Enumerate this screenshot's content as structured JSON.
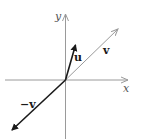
{
  "diagram": {
    "axes": {
      "x_label": "x",
      "y_label": "y",
      "color": "#9a9a9a"
    },
    "vectors": [
      {
        "name": "u",
        "label": "u",
        "color": "#1a1a1a"
      },
      {
        "name": "v",
        "label": "v",
        "color": "#9a9a9a"
      },
      {
        "name": "neg-v",
        "label": "−v",
        "color": "#1a1a1a"
      }
    ]
  }
}
